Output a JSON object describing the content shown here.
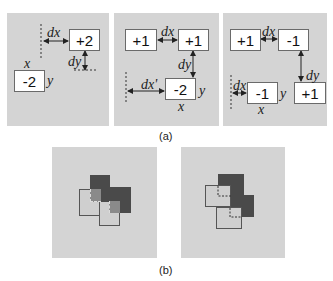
{
  "part_a": {
    "caption": "(a)",
    "panels": [
      {
        "boxes": [
          {
            "label": "+2"
          },
          {
            "label": "-2"
          }
        ],
        "labels": {
          "dx": "dx",
          "dy": "dy",
          "x": "x",
          "y": "y"
        }
      },
      {
        "boxes": [
          {
            "label": "+1"
          },
          {
            "label": "+1"
          },
          {
            "label": "-2"
          }
        ],
        "labels": {
          "dx": "dx",
          "dy": "dy",
          "dx_prime": "dx'",
          "x": "x",
          "y": "y"
        }
      },
      {
        "boxes": [
          {
            "label": "+1"
          },
          {
            "label": "-1"
          },
          {
            "label": "-1"
          },
          {
            "label": "+1"
          }
        ],
        "labels": {
          "dx": "dx",
          "dy": "dy",
          "dx_prime": "dx",
          "x": "x",
          "y": "y"
        }
      }
    ]
  },
  "part_b": {
    "caption": "(b)",
    "colors": {
      "background": "#d4d4d4",
      "dark": "#4a4a4a",
      "light": "#cfcfcf",
      "overlap": "#8a8a8a"
    }
  }
}
